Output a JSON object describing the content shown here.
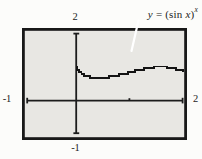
{
  "figure": {
    "equation": {
      "y": "y",
      "equals": " = (",
      "function": "sin",
      "argument": "x",
      "close": ")",
      "exponent": "x"
    },
    "axis_labels": {
      "top": "2",
      "left": "-1",
      "right": "2",
      "bottom": "-1"
    }
  },
  "colors": {
    "page_bg": "#fcfcfa",
    "plot_bg": "#e8e7e3",
    "frame": "#181818",
    "axis": "#1c1c1c",
    "curve": "#141414",
    "leader_line": "#ffffff",
    "text": "#1c1c1c"
  },
  "chart_data": {
    "type": "line",
    "xlabel": "",
    "ylabel": "",
    "xlim": [
      -1,
      2
    ],
    "ylim": [
      -1,
      2
    ],
    "x_axis_end_labels": [
      "-1",
      "2"
    ],
    "y_axis_end_labels": [
      "-1",
      "2"
    ],
    "x_ticks": [
      1
    ],
    "grid": false,
    "legend": false,
    "series": [
      {
        "name": "y = (sin x)^x",
        "x": [
          0.005,
          0.02,
          0.06,
          0.1,
          0.14,
          0.18,
          0.22,
          0.26,
          0.3,
          0.35,
          0.4,
          0.45,
          0.5,
          0.56,
          0.62,
          0.68,
          0.74,
          0.8,
          0.86,
          0.92,
          0.98,
          1.04,
          1.1,
          1.16,
          1.22,
          1.28,
          1.34,
          1.4,
          1.46,
          1.52,
          1.58,
          1.64,
          1.7,
          1.76,
          1.82,
          1.88,
          1.94,
          2.0
        ],
        "y": [
          0.993,
          0.925,
          0.845,
          0.794,
          0.759,
          0.734,
          0.715,
          0.702,
          0.694,
          0.688,
          0.686,
          0.688,
          0.692,
          0.702,
          0.714,
          0.729,
          0.747,
          0.767,
          0.788,
          0.81,
          0.834,
          0.857,
          0.881,
          0.904,
          0.926,
          0.946,
          0.965,
          0.98,
          0.991,
          0.998,
          1.0,
          0.996,
          0.986,
          0.969,
          0.944,
          0.913,
          0.875,
          0.827
        ]
      }
    ]
  }
}
